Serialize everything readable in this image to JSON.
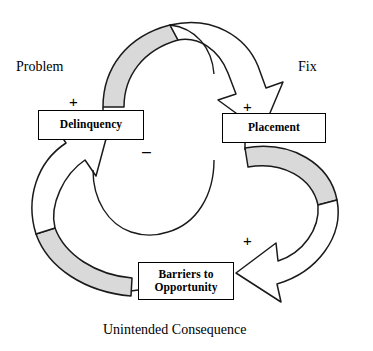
{
  "diagram": {
    "type": "causal-loop-diagram",
    "background_color": "#ffffff",
    "stroke_color": "#000000",
    "shaded_fill_color": "#d9d9d9",
    "arrow_fill_color": "#ffffff",
    "captions": {
      "problem": "Problem",
      "fix": "Fix",
      "unintended": "Unintended Consequence"
    },
    "nodes": [
      {
        "id": "delinquency",
        "label": "Delinquency",
        "x": 38,
        "y": 110,
        "width": 106,
        "height": 30
      },
      {
        "id": "placement",
        "label": "Placement",
        "x": 222,
        "y": 113,
        "width": 104,
        "height": 30
      },
      {
        "id": "barriers",
        "label": "Barriers to\nOpportunity",
        "x": 138,
        "y": 262,
        "width": 96,
        "height": 38
      }
    ],
    "links": [
      {
        "id": "delinquency-to-placement",
        "from": "delinquency",
        "to": "placement",
        "polarity": "+",
        "section": "Fix",
        "shaded_tail": true
      },
      {
        "id": "placement-to-barriers",
        "from": "placement",
        "to": "barriers",
        "polarity": "+",
        "section": "Unintended Consequence",
        "shaded_tail": true
      },
      {
        "id": "barriers-to-delinquency",
        "from": "barriers",
        "to": "delinquency",
        "polarity": "-",
        "section": "Problem",
        "shaded_tail": true
      }
    ],
    "polarities": {
      "delinquency_plus": "+",
      "placement_plus": "+",
      "barriers_plus": "+",
      "delinquency_minus": "–"
    }
  }
}
